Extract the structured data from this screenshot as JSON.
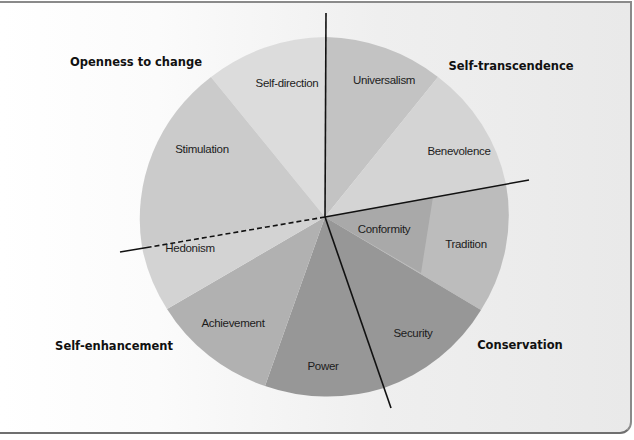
{
  "diagram": {
    "type": "circular value model",
    "center": [
      325,
      217
    ],
    "radius": [
      185,
      180
    ],
    "groups": [
      {
        "id": "openness",
        "label": "Openness to change",
        "position": [
          104,
          62
        ]
      },
      {
        "id": "self_transcendence",
        "label": "Self-transcendence",
        "position": [
          463,
          66
        ]
      },
      {
        "id": "self_enhancement",
        "label": "Self-enhancement",
        "position": [
          53,
          346
        ]
      },
      {
        "id": "conservation",
        "label": "Conservation",
        "position": [
          486,
          349
        ]
      }
    ],
    "values": [
      {
        "id": "self_direction",
        "label": "Self-direction",
        "color": "#dcdcdc",
        "label_pos": [
          287,
          83
        ]
      },
      {
        "id": "universalism",
        "label": "Universalism",
        "color": "#c3c3c3",
        "label_pos": [
          384,
          80
        ]
      },
      {
        "id": "benevolence",
        "label": "Benevolence",
        "color": "#d4d4d4",
        "label_pos": [
          459,
          151
        ]
      },
      {
        "id": "tradition",
        "label": "Tradition",
        "color": "#bcbcbc",
        "label_pos": [
          466,
          244
        ]
      },
      {
        "id": "conformity",
        "label": "Conformity",
        "color": "#a9a9a9",
        "label_pos": [
          384,
          229
        ]
      },
      {
        "id": "security",
        "label": "Security",
        "color": "#979797",
        "label_pos": [
          413,
          333
        ]
      },
      {
        "id": "power",
        "label": "Power",
        "color": "#979797",
        "label_pos": [
          323,
          366
        ]
      },
      {
        "id": "achievement",
        "label": "Achievement",
        "color": "#b1b1b1",
        "label_pos": [
          233,
          323
        ]
      },
      {
        "id": "hedonism",
        "label": "Hedonism",
        "color": "#d3d3d3",
        "label_pos": [
          188,
          248
        ]
      },
      {
        "id": "stimulation",
        "label": "Stimulation",
        "color": "#cbcbcb",
        "label_pos": [
          200,
          149
        ]
      }
    ],
    "dividers": [
      {
        "id": "vertical",
        "from": [
          326,
          13
        ],
        "to": [
          325,
          217
        ],
        "style": "solid"
      },
      {
        "id": "right",
        "from": [
          325,
          217
        ],
        "to": [
          529,
          180
        ],
        "style": "solid"
      },
      {
        "id": "lower",
        "from": [
          325,
          217
        ],
        "to": [
          391,
          408
        ],
        "style": "solid"
      },
      {
        "id": "hedonism_split",
        "from": [
          325,
          217
        ],
        "to": [
          150,
          247
        ],
        "style": "dashed"
      },
      {
        "id": "hedonism_tail",
        "from": [
          150,
          247
        ],
        "to": [
          120,
          252
        ],
        "style": "solid"
      }
    ]
  }
}
